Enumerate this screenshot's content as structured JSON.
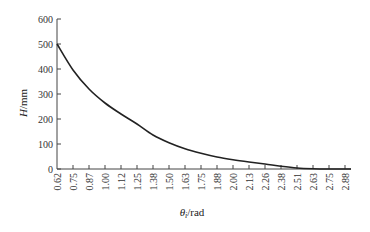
{
  "chart_data": {
    "type": "line",
    "title": "",
    "xlabel": "θ_i/rad",
    "xlabel_main": "θ",
    "xlabel_sub": "i",
    "xlabel_unit": "/rad",
    "ylabel": "H/mm",
    "ylabel_main": "H",
    "ylabel_unit": "/mm",
    "ylim": [
      0,
      600
    ],
    "yticks": [
      0,
      100,
      200,
      300,
      400,
      500,
      600
    ],
    "xticks": [
      "0.62",
      "0.75",
      "0.87",
      "1.00",
      "1.12",
      "1.25",
      "1.38",
      "1.50",
      "1.63",
      "1.75",
      "1.88",
      "2.00",
      "2.13",
      "2.26",
      "2.38",
      "2.51",
      "2.63",
      "2.75",
      "2.88"
    ],
    "grid": false,
    "legend": null,
    "series": [
      {
        "name": "H",
        "x": [
          0.62,
          0.75,
          0.87,
          1.0,
          1.12,
          1.25,
          1.38,
          1.5,
          1.63,
          1.75,
          1.88,
          2.0,
          2.13,
          2.26,
          2.38,
          2.51,
          2.63,
          2.75,
          2.88
        ],
        "values": [
          500,
          396,
          320,
          264,
          220,
          180,
          136,
          105,
          81,
          63,
          48,
          37,
          28,
          20,
          11,
          4,
          1,
          0,
          0
        ]
      }
    ]
  }
}
